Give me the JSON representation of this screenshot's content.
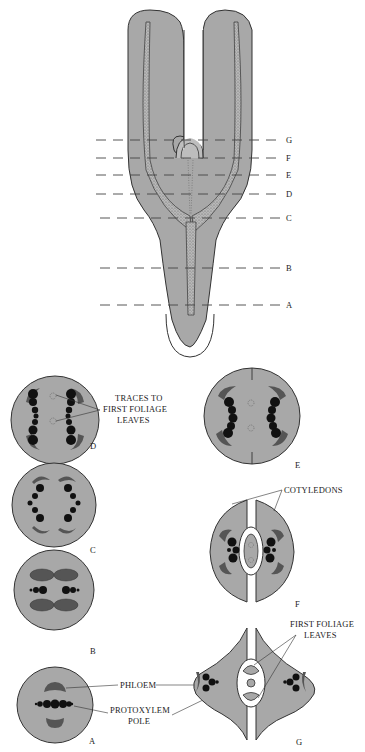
{
  "figure": {
    "fill_color": "#a8a8a8",
    "vascular_color": "#111111",
    "phloem_color": "#5a5a5a",
    "levels": [
      "G",
      "F",
      "E",
      "D",
      "C",
      "B",
      "A"
    ]
  },
  "sections": {
    "A": "A",
    "B": "B",
    "C": "C",
    "D": "D",
    "E": "E",
    "F": "F",
    "G": "G"
  },
  "labels": {
    "traces_line1": "TRACES TO",
    "traces_line2": "FIRST FOLIAGE",
    "traces_line3": "LEAVES",
    "cotyledons": "COTYLEDONS",
    "first_foliage_line1": "FIRST FOLIAGE",
    "first_foliage_line2": "LEAVES",
    "phloem": "PHLOEM",
    "protoxylem_line1": "PROTOXYLEM",
    "protoxylem_line2": "POLE"
  }
}
